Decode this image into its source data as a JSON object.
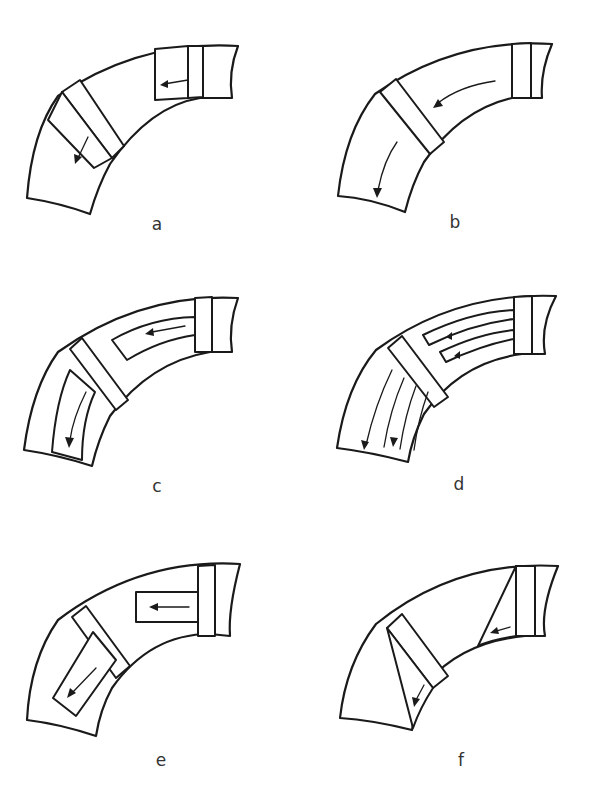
{
  "figure": {
    "panels": [
      {
        "id": "a",
        "label": "a",
        "hatched_body": true,
        "channels": "two straight transverse openings with flow arrows"
      },
      {
        "id": "b",
        "label": "b",
        "hatched_body": false,
        "channels": "open curved passage with flow arrows"
      },
      {
        "id": "c",
        "label": "c",
        "hatched_body": true,
        "channels": "single curved channel with flow arrows"
      },
      {
        "id": "d",
        "label": "d",
        "hatched_body": true,
        "channels": "multiple curved channels with flow arrows"
      },
      {
        "id": "e",
        "label": "e",
        "hatched_body": true,
        "channels": "straight rectangular channels with flow arrows"
      },
      {
        "id": "f",
        "label": "f",
        "hatched_body": true,
        "channels": "triangular wedge channels with flow arrows"
      }
    ]
  },
  "colors": {
    "ink": "#1a1a1a",
    "background": "#ffffff",
    "label": "#333333"
  }
}
